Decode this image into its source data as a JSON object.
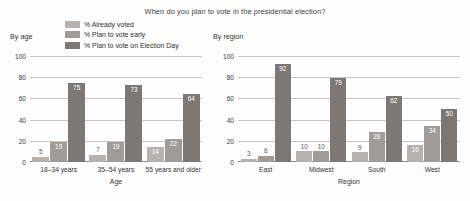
{
  "title": "When do you plan to vote in the presidential election?",
  "legend": {
    "items": [
      {
        "label": "% Already voted",
        "color": "#b6b3ae"
      },
      {
        "label": "% Plan to vote early",
        "color": "#a09d98"
      },
      {
        "label": "% Plan to vote on Election Day",
        "color": "#7c7975"
      }
    ]
  },
  "panels": {
    "age": {
      "caption": "By age"
    },
    "region": {
      "caption": "By region"
    }
  },
  "chart_data": [
    {
      "type": "bar",
      "title": "When do you plan to vote in the presidential election?",
      "subtitle": "By age",
      "xlabel": "Age",
      "ylabel": "",
      "ylim": [
        0,
        100
      ],
      "yticks": [
        0,
        20,
        40,
        60,
        80,
        100
      ],
      "grid": true,
      "legend_position": "top-center",
      "categories": [
        "18–34 years",
        "35–54 years",
        "55 years and older"
      ],
      "series": [
        {
          "name": "% Already voted",
          "color": "#b6b3ae",
          "values": [
            5,
            7,
            14
          ]
        },
        {
          "name": "% Plan to vote early",
          "color": "#a09d98",
          "values": [
            19,
            19,
            22
          ]
        },
        {
          "name": "% Plan to vote on Election Day",
          "color": "#7c7975",
          "values": [
            75,
            73,
            64
          ]
        }
      ]
    },
    {
      "type": "bar",
      "title": "When do you plan to vote in the presidential election?",
      "subtitle": "By region",
      "xlabel": "Region",
      "ylabel": "",
      "ylim": [
        0,
        100
      ],
      "yticks": [
        0,
        20,
        40,
        60,
        80,
        100
      ],
      "grid": true,
      "legend_position": "top-center",
      "categories": [
        "East",
        "Midwest",
        "South",
        "West"
      ],
      "series": [
        {
          "name": "% Already voted",
          "color": "#b6b3ae",
          "values": [
            3,
            10,
            9,
            16
          ]
        },
        {
          "name": "% Plan to vote early",
          "color": "#a09d98",
          "values": [
            6,
            10,
            28,
            34
          ]
        },
        {
          "name": "% Plan to vote on Election Day",
          "color": "#7c7975",
          "values": [
            92,
            79,
            62,
            50
          ]
        }
      ]
    }
  ]
}
